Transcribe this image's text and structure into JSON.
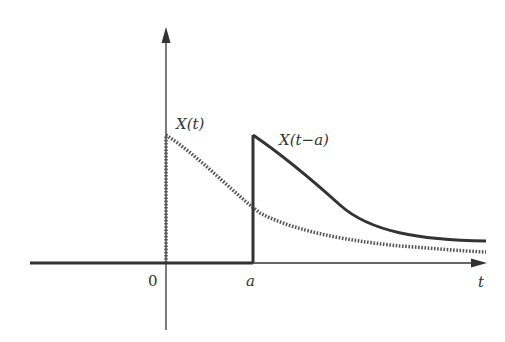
{
  "diagram": {
    "labels": {
      "original_curve": "X(t)",
      "shifted_curve": "X(t−a)",
      "origin": "0",
      "shift": "a",
      "t_axis": "t"
    },
    "colors": {
      "axis": "#333333",
      "shifted_curve": "#333333",
      "original_curve": "#555555",
      "background": "#ffffff"
    },
    "styles": {
      "original_curve": "dotted",
      "shifted_curve": "solid thick"
    }
  }
}
